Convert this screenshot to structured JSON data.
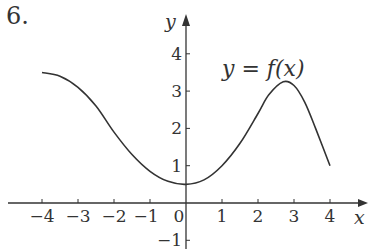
{
  "problem_number": "6.",
  "chart_data": {
    "type": "line",
    "title": "",
    "curve_label": "y = f(x)",
    "xlabel": "x",
    "ylabel": "y",
    "xlim": [
      -4.5,
      5
    ],
    "ylim": [
      -1.3,
      4.6
    ],
    "x_ticks": [
      -4,
      -3,
      -2,
      -1,
      0,
      1,
      2,
      3,
      4
    ],
    "x_tick_labels": [
      "−4",
      "−3",
      "−2",
      "−1",
      "0",
      "1",
      "2",
      "3",
      "4"
    ],
    "y_ticks": [
      -1,
      1,
      2,
      3,
      4
    ],
    "y_tick_labels": [
      "−1",
      "1",
      "2",
      "3",
      "4"
    ],
    "grid": false,
    "series": [
      {
        "name": "f(x)",
        "x": [
          -4,
          -3.5,
          -3,
          -2.5,
          -2,
          -1.5,
          -1,
          -0.5,
          0,
          0.5,
          1,
          1.5,
          2,
          2.3,
          2.7,
          3,
          3.3,
          3.6,
          4
        ],
        "values": [
          3.5,
          3.4,
          3.1,
          2.6,
          1.9,
          1.3,
          0.85,
          0.58,
          0.5,
          0.62,
          1.0,
          1.6,
          2.4,
          2.9,
          3.25,
          3.15,
          2.7,
          2.0,
          1.0
        ]
      }
    ]
  },
  "colors": {
    "curve": "#333333",
    "axis": "#333333",
    "background": "#ffffff"
  }
}
